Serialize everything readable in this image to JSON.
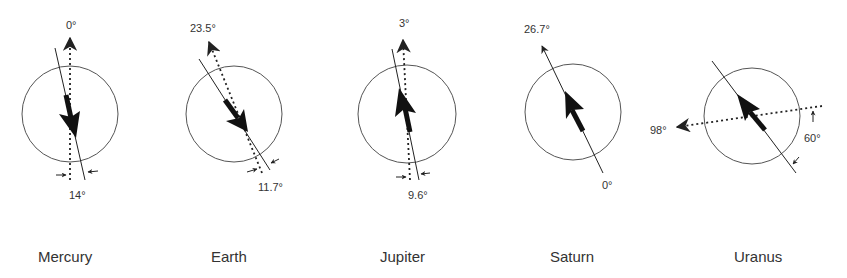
{
  "figure": {
    "planets": [
      {
        "name": "Mercury",
        "rotation_axis_tilt": "0°",
        "magnetic_tilt": "14°"
      },
      {
        "name": "Earth",
        "rotation_axis_tilt": "23.5°",
        "magnetic_tilt": "11.7°"
      },
      {
        "name": "Jupiter",
        "rotation_axis_tilt": "3°",
        "magnetic_tilt": "9.6°"
      },
      {
        "name": "Saturn",
        "rotation_axis_tilt": "26.7°",
        "magnetic_tilt": "0°"
      },
      {
        "name": "Uranus",
        "rotation_axis_tilt": "98°",
        "magnetic_tilt": "60°"
      }
    ]
  },
  "colors": {
    "stroke": "#222222",
    "circle": "#555555",
    "text": "#333333"
  }
}
